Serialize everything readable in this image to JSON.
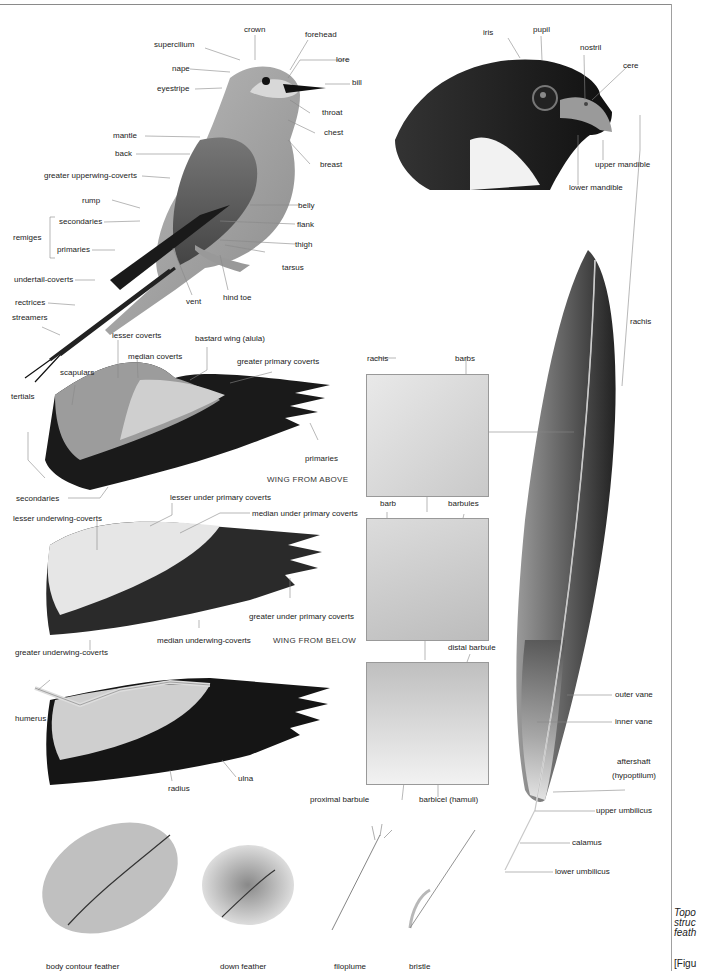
{
  "bird_topography": {
    "labels": {
      "crown": "crown",
      "forehead": "forehead",
      "supercilium": "supercilium",
      "lore": "lore",
      "nape": "nape",
      "bill": "bill",
      "eyestripe": "eyestripe",
      "throat": "throat",
      "chest": "chest",
      "mantle": "mantle",
      "back": "back",
      "breast": "breast",
      "greater_upperwing_coverts": "greater upperwing-coverts",
      "rump": "rump",
      "belly": "belly",
      "secondaries": "secondaries",
      "flank": "flank",
      "remiges": "remiges",
      "thigh": "thigh",
      "primaries": "primaries",
      "tarsus": "tarsus",
      "undertail_coverts": "undertail-coverts",
      "hind_toe": "hind toe",
      "vent": "vent",
      "rectrices": "rectrices",
      "streamers": "streamers"
    }
  },
  "falcon_head": {
    "labels": {
      "iris": "iris",
      "pupil": "pupil",
      "nostril": "nostril",
      "cere": "cere",
      "upper_mandible": "upper mandible",
      "lower_mandible": "lower mandible"
    }
  },
  "wing_above": {
    "caption": "WING FROM ABOVE",
    "labels": {
      "lesser_coverts": "lesser coverts",
      "bastard_wing": "bastard wing (alula)",
      "median_coverts": "median coverts",
      "greater_primary_coverts": "greater primary coverts",
      "scapulars": "scapulars",
      "tertials": "tertials",
      "primaries": "primaries",
      "secondaries": "secondaries"
    }
  },
  "wing_below": {
    "caption": "WING FROM BELOW",
    "labels": {
      "lesser_under_primary_coverts": "lesser under primary coverts",
      "lesser_underwing_coverts": "lesser underwing-coverts",
      "median_under_primary_coverts": "median under primary coverts",
      "greater_under_primary_coverts": "greater under primary coverts",
      "median_underwing_coverts": "median underwing-coverts",
      "greater_underwing_coverts": "greater underwing-coverts"
    }
  },
  "wing_skeleton": {
    "labels": {
      "humerus": "humerus",
      "ulna": "ulna",
      "radius": "radius"
    }
  },
  "feather_detail": {
    "labels": {
      "rachis_detail": "rachis",
      "barbs": "barbs",
      "barb": "barb",
      "barbules": "barbules",
      "distal_barbule": "distal barbule",
      "proximal_barbule": "proximal barbule",
      "barbicel": "barbicel (hamuli)"
    }
  },
  "flight_feather": {
    "labels": {
      "rachis": "rachis",
      "outer_vane": "outer vane",
      "inner_vane": "inner vane",
      "aftershaft": "aftershaft",
      "hypoptilum": "(hypoptilum)",
      "upper_umbilicus": "upper umbilicus",
      "calamus": "calamus",
      "lower_umbilicus": "lower umbilicus"
    }
  },
  "feather_types": [
    {
      "label": "body contour feather"
    },
    {
      "label": "down feather"
    },
    {
      "label": "filoplume"
    },
    {
      "label": "bristle"
    }
  ],
  "sidebar_caption": {
    "line1": "Topo",
    "line2": "struc",
    "line3": "feath",
    "figure_ref": "[Figu"
  }
}
